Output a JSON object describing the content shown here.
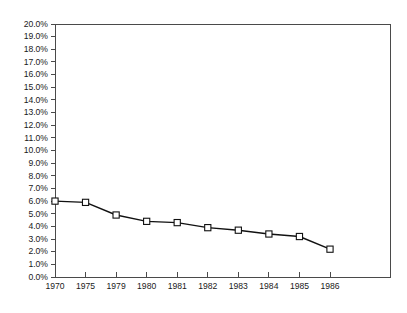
{
  "chart_data": {
    "type": "line",
    "title": "",
    "subtitle": "",
    "xlabel": "",
    "ylabel": "",
    "categories": [
      "1970",
      "1975",
      "1979",
      "1980",
      "1981",
      "1982",
      "1983",
      "1984",
      "1985",
      "1986"
    ],
    "values": [
      6.0,
      5.9,
      4.9,
      4.4,
      4.3,
      3.9,
      3.7,
      3.4,
      3.2,
      2.2
    ],
    "series": [
      {
        "name": "",
        "values": [
          6.0,
          5.9,
          4.9,
          4.4,
          4.3,
          3.9,
          3.7,
          3.4,
          3.2,
          2.2
        ]
      }
    ],
    "ylim": [
      0.0,
      20.0
    ],
    "ytick_step": 1.0,
    "ytick_labels": [
      "0.0%",
      "1.0%",
      "2.0%",
      "3.0%",
      "4.0%",
      "5.0%",
      "6.0%",
      "7.0%",
      "8.0%",
      "9.0%",
      "10.0%",
      "11.0%",
      "12.0%",
      "13.0%",
      "14.0%",
      "15.0%",
      "16.0%",
      "17.0%",
      "18.0%",
      "19.0%",
      "20.0%"
    ],
    "ytick_values": [
      0,
      1,
      2,
      3,
      4,
      5,
      6,
      7,
      8,
      9,
      10,
      11,
      12,
      13,
      14,
      15,
      16,
      17,
      18,
      19,
      20
    ],
    "xtick_labels": [
      "1970",
      "1975",
      "1979",
      "1980",
      "1981",
      "1982",
      "1983",
      "1984",
      "1985",
      "1986"
    ],
    "grid": false,
    "legend": false,
    "legend_position": "none",
    "marker": "square-open",
    "line_color": "#111111",
    "marker_fill": "#ffffff",
    "marker_stroke": "#111111",
    "axis_color": "#4a4a4a",
    "background_color": "#ffffff"
  },
  "layout": {
    "plot_left": 55,
    "plot_top": 24,
    "plot_right": 390,
    "plot_bottom": 277,
    "data_x_start": 55,
    "data_x_end": 330
  }
}
